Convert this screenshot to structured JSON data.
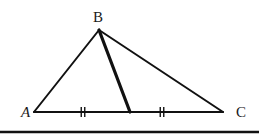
{
  "diagram": {
    "type": "triangle-with-median",
    "stroke_color": "#111111",
    "background": "#ffffff",
    "vertices": {
      "A": {
        "label": "A",
        "x": 34,
        "y": 112,
        "label_x": 21,
        "label_y": 117,
        "italic": true
      },
      "B": {
        "label": "B",
        "x": 99,
        "y": 30,
        "label_x": 93,
        "label_y": 22,
        "italic": false
      },
      "C": {
        "label": "C",
        "x": 223,
        "y": 112,
        "label_x": 236,
        "label_y": 117,
        "italic": false
      }
    },
    "median": {
      "from": "B",
      "to": "M",
      "x": 130,
      "y": 112,
      "stroke_width": 3.2
    },
    "equal_segment_marks": [
      {
        "segment": "AM",
        "x": 83,
        "y": 112,
        "ticks": 2
      },
      {
        "segment": "MC",
        "x": 162,
        "y": 112,
        "ticks": 2
      }
    ],
    "base_rule": {
      "y": 132,
      "x1": 0,
      "x2": 259,
      "stroke_width": 2.5
    }
  }
}
